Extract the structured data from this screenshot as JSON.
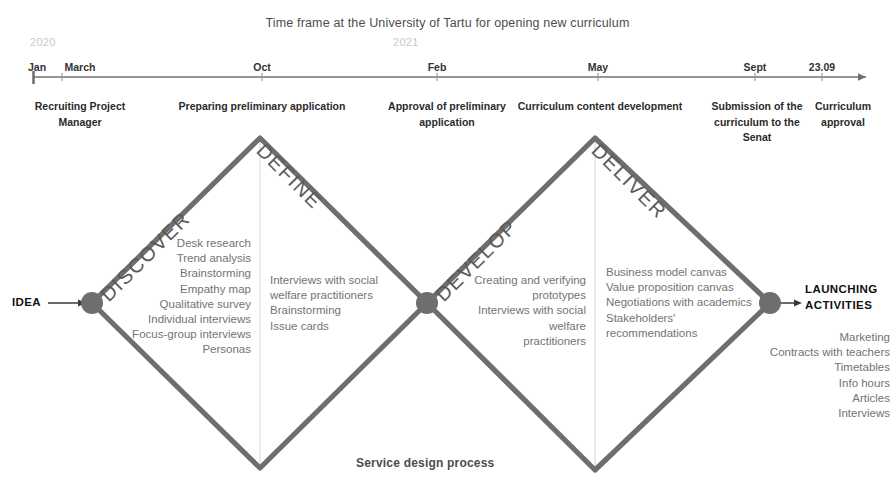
{
  "title": "Time frame at the University of Tartu for opening new curriculum",
  "bottom_caption": "Service design process",
  "colors": {
    "diamond_stroke": "#6e6e6e",
    "node_fill": "#6e6e6e",
    "divider": "#dcdcdc",
    "axis": "#707070",
    "body_text": "#737373",
    "heading_text": "#2b2b2b",
    "year_text": "#c9c9c9"
  },
  "timeline": {
    "years": [
      {
        "label": "2020",
        "x": 30
      },
      {
        "label": "2021",
        "x": 393
      }
    ],
    "ticks": [
      {
        "label": "Jan",
        "x": 37
      },
      {
        "label": "March",
        "x": 80
      },
      {
        "label": "Oct",
        "x": 262
      },
      {
        "label": "Feb",
        "x": 437
      },
      {
        "label": "May",
        "x": 598
      },
      {
        "label": "Sept",
        "x": 755
      },
      {
        "label": "23.09",
        "x": 822
      }
    ],
    "milestones": [
      {
        "label": "Recruiting\nProject Manager",
        "x": 80,
        "width": 130
      },
      {
        "label": "Preparing preliminary application",
        "x": 262,
        "width": 230
      },
      {
        "label": "Approval of\npreliminary application",
        "x": 447,
        "width": 150
      },
      {
        "label": "Curriculum content development",
        "x": 600,
        "width": 200
      },
      {
        "label": "Submission of\nthe curriculum\nto the Senat",
        "x": 757,
        "width": 100
      },
      {
        "label": "Curriculum\napproval",
        "x": 843,
        "width": 90
      }
    ]
  },
  "stages": [
    {
      "name": "DISCOVER",
      "x": 96,
      "y": 290,
      "angle": -45
    },
    {
      "name": "DEFINE",
      "x": 266,
      "y": 137,
      "angle": 45
    },
    {
      "name": "DEVELOP",
      "x": 431,
      "y": 290,
      "angle": -45
    },
    {
      "name": "DELIVER",
      "x": 601,
      "y": 137,
      "angle": 45
    }
  ],
  "method_lists": {
    "discover": {
      "items": "Desk research\nTrend analysis\nBrainstorming\nEmpathy map\nQualitative survey\nIndividual interviews\nFocus-group interviews\nPersonas"
    },
    "define": {
      "items": "Interviews with social\nwelfare practitioners\nBrainstorming\nIssue cards"
    },
    "develop": {
      "items": "Creating and verifying\nprototypes\nInterviews with social welfare\npractitioners"
    },
    "deliver": {
      "items": "Business model canvas\nValue proposition canvas\nNegotiations with academics\nStakeholders'\nrecommendations"
    }
  },
  "endpoints": {
    "start_label": "IDEA",
    "end_label": "LAUNCHING\nACTIVITIES",
    "end_list": "Marketing\nContracts with teachers\nTimetables\nInfo hours\nArticles\nInterviews"
  }
}
